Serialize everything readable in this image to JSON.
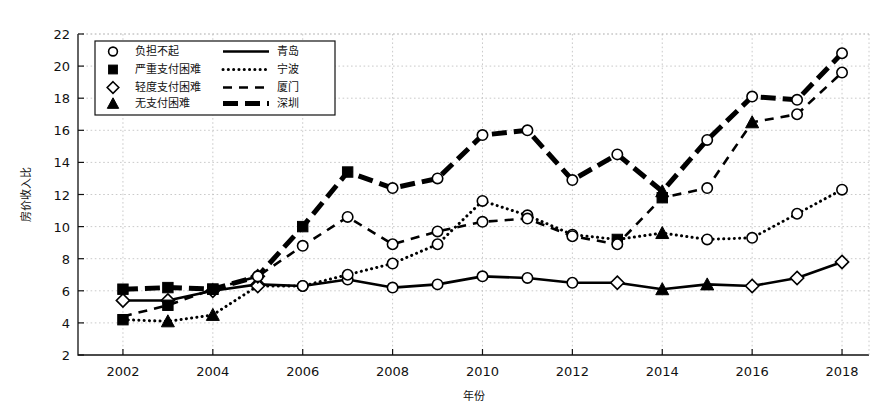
{
  "chart_data": {
    "type": "line",
    "title": "",
    "xlabel": "年份",
    "ylabel": "房价收入比",
    "xlim": [
      2001,
      2018.6
    ],
    "ylim": [
      2,
      22
    ],
    "ytick_step": 2,
    "xtick_step": 2,
    "grid": true,
    "legend_position": "upper-left-inside",
    "x": [
      2002,
      2003,
      2004,
      2005,
      2006,
      2007,
      2008,
      2009,
      2010,
      2011,
      2012,
      2013,
      2014,
      2015,
      2016,
      2017,
      2018
    ],
    "xtick_labels": [
      "2002",
      "2004",
      "2006",
      "2008",
      "2010",
      "2012",
      "2014",
      "2016",
      "2018"
    ],
    "ytick_labels": [
      "2",
      "4",
      "6",
      "8",
      "10",
      "12",
      "14",
      "16",
      "18",
      "20",
      "22"
    ],
    "series": [
      {
        "name": "青岛",
        "line_style": "solid",
        "values": [
          5.4,
          5.4,
          6.0,
          6.4,
          6.3,
          6.7,
          6.2,
          6.4,
          6.9,
          6.8,
          6.5,
          6.5,
          6.1,
          6.4,
          6.3,
          6.8,
          7.8
        ],
        "markers": [
          "diamond",
          "diamond",
          "diamond",
          "diamond",
          "circle",
          "circle",
          "circle",
          "circle",
          "circle",
          "circle",
          "circle",
          "diamond",
          "triangle",
          "triangle",
          "diamond",
          "diamond",
          "diamond"
        ]
      },
      {
        "name": "宁波",
        "line_style": "dotted",
        "values": [
          4.2,
          4.1,
          4.5,
          6.3,
          6.3,
          7.0,
          7.7,
          8.9,
          11.6,
          10.7,
          9.5,
          9.2,
          9.6,
          9.2,
          9.3,
          10.8,
          12.3
        ],
        "markers": [
          "square",
          "triangle",
          "triangle",
          "diamond",
          "circle",
          "circle",
          "circle",
          "circle",
          "circle",
          "circle",
          "circle",
          "square",
          "triangle",
          "circle",
          "circle",
          "circle",
          "circle"
        ]
      },
      {
        "name": "厦门",
        "line_style": "dashed",
        "values": [
          4.4,
          5.1,
          6.1,
          6.9,
          8.8,
          10.6,
          8.9,
          9.7,
          10.3,
          10.5,
          9.4,
          8.9,
          11.8,
          12.4,
          16.5,
          17.0,
          19.6
        ],
        "markers": [
          "none",
          "square",
          "square",
          "diamond",
          "circle",
          "circle",
          "circle",
          "circle",
          "circle",
          "circle",
          "circle",
          "circle",
          "square",
          "circle",
          "triangle",
          "circle",
          "circle"
        ]
      },
      {
        "name": "深圳",
        "line_style": "thick-dashed",
        "values": [
          6.1,
          6.2,
          6.1,
          6.9,
          10.0,
          13.4,
          12.4,
          13.0,
          15.7,
          16.0,
          12.9,
          14.5,
          12.2,
          15.4,
          18.1,
          17.9,
          20.8
        ],
        "markers": [
          "square",
          "square",
          "square",
          "circle",
          "square",
          "square",
          "circle",
          "circle",
          "circle",
          "circle",
          "circle",
          "circle",
          "triangle",
          "circle",
          "circle",
          "circle",
          "circle"
        ]
      }
    ]
  },
  "legend": {
    "marker_entries": [
      {
        "marker": "circle",
        "label": "负担不起"
      },
      {
        "marker": "square",
        "label": "严重支付困难"
      },
      {
        "marker": "diamond",
        "label": "轻度支付困难"
      },
      {
        "marker": "triangle",
        "label": "无支付困难"
      }
    ],
    "line_entries": [
      {
        "style": "solid",
        "label": "青岛"
      },
      {
        "style": "dotted",
        "label": "宁波"
      },
      {
        "style": "dashed",
        "label": "厦门"
      },
      {
        "style": "thick-dashed",
        "label": "深圳"
      }
    ]
  },
  "colors": {
    "ink": "#000000",
    "grid": "#bdbdbd",
    "background": "#ffffff"
  }
}
